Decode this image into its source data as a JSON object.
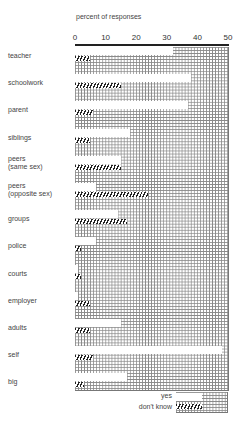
{
  "chart_data": {
    "type": "bar",
    "title": "percent of responses",
    "xlabel": "percent of responses",
    "ylabel": "",
    "xlim": [
      0,
      50
    ],
    "x_ticks": [
      "0",
      "10",
      "20",
      "30",
      "40",
      "50"
    ],
    "grid": true,
    "orientation": "horizontal",
    "categories": [
      "teacher",
      "schoolwork",
      "parent",
      "siblings",
      "peers (same sex)",
      "peers (opposite sex)",
      "groups",
      "police",
      "courts",
      "employer",
      "adults",
      "self",
      "big"
    ],
    "series": [
      {
        "name": "yes",
        "style": "white",
        "values": [
          32,
          38,
          37,
          18,
          15,
          7,
          14,
          7,
          1,
          1,
          15,
          48,
          17
        ]
      },
      {
        "name": "don't know",
        "style": "hatched",
        "values": [
          5,
          15,
          6,
          5,
          15,
          24,
          17,
          2,
          2,
          5,
          5,
          6,
          3
        ]
      }
    ],
    "legend": {
      "position": "bottom-right",
      "entries": [
        "yes",
        "don't know"
      ]
    }
  },
  "labels": {
    "title": "percent of responses",
    "ticks": [
      "0",
      "10",
      "20",
      "30",
      "40",
      "50"
    ],
    "categories": [
      {
        "line1": "teacher",
        "line2": ""
      },
      {
        "line1": "schoolwork",
        "line2": ""
      },
      {
        "line1": "parent",
        "line2": ""
      },
      {
        "line1": "siblings",
        "line2": ""
      },
      {
        "line1": "peers",
        "line2": "(same sex)"
      },
      {
        "line1": "peers",
        "line2": "(opposite sex)"
      },
      {
        "line1": "groups",
        "line2": ""
      },
      {
        "line1": "police",
        "line2": ""
      },
      {
        "line1": "courts",
        "line2": ""
      },
      {
        "line1": "employer",
        "line2": ""
      },
      {
        "line1": "adults",
        "line2": ""
      },
      {
        "line1": "self",
        "line2": ""
      },
      {
        "line1": "big",
        "line2": ""
      }
    ],
    "legend_yes": "yes",
    "legend_dk": "don't know"
  }
}
